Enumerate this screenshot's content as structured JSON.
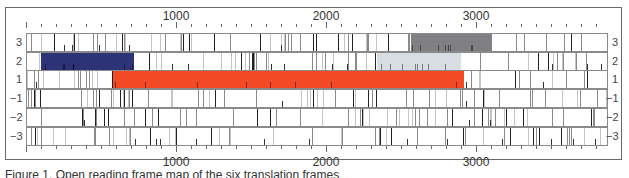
{
  "figure": {
    "type": "six-frame ORF map",
    "axis": {
      "top_labels": [
        {
          "value": "1000",
          "x": 176
        },
        {
          "value": "2000",
          "x": 326
        },
        {
          "value": "3000",
          "x": 476
        }
      ],
      "bottom_labels": [
        {
          "value": "1000",
          "x": 176
        },
        {
          "value": "2000",
          "x": 326
        },
        {
          "value": "3000",
          "x": 476
        }
      ],
      "tick_interval_bp": 100,
      "range_bp": [
        0,
        3880
      ]
    },
    "frames": [
      {
        "label": "3",
        "right_label": "3"
      },
      {
        "label": "2",
        "right_label": "2"
      },
      {
        "label": "1",
        "right_label": "1"
      },
      {
        "label": "−1",
        "right_label": "−1"
      },
      {
        "label": "−2",
        "right_label": "−2"
      },
      {
        "label": "−3",
        "right_label": "−3"
      }
    ],
    "orfs": [
      {
        "frame": "3",
        "start_bp": 2560,
        "end_bp": 3100,
        "color": "#7f7f84"
      },
      {
        "frame": "2",
        "start_bp": 90,
        "end_bp": 715,
        "color": "#2e3377"
      },
      {
        "frame": "2",
        "start_bp": 2330,
        "end_bp": 2890,
        "color": "#d8dce3"
      },
      {
        "frame": "1",
        "start_bp": 575,
        "end_bp": 2910,
        "color": "#f14a24"
      }
    ],
    "caption_partial": "Figure 1. Open reading frame map of the six translation frames"
  }
}
